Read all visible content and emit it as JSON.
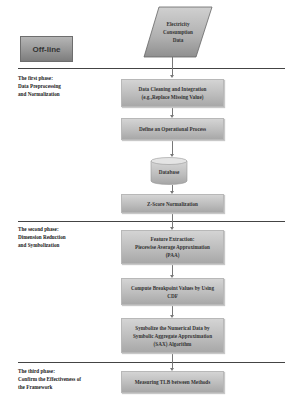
{
  "offline_label": "Off-line",
  "input": {
    "line1": "Electricity",
    "line2": "Consumption",
    "line3": "Data"
  },
  "phases": [
    {
      "line1": "The first phase:",
      "line2": "Data Preprocessing",
      "line3": "and Normalization"
    },
    {
      "line1": "The second phase:",
      "line2": "Dimension Reduction",
      "line3": "and Symbolization"
    },
    {
      "line1": "The third phase:",
      "line2": "Confirm the Effectiveness of",
      "line3": "the Framework"
    }
  ],
  "steps": {
    "cleaning": {
      "line1": "Data Cleaning and Integration",
      "line2": "(e.g.,Replace Missing Value)"
    },
    "operational": {
      "line1": "Define an Operational Process"
    },
    "database": {
      "line1": "Database"
    },
    "zscore": {
      "line1": "Z-Score Normalization"
    },
    "paa": {
      "line1": "Feature Extraction:",
      "line2": "Piecewise Average Approximation",
      "line3": "(PAA)"
    },
    "breakpoint": {
      "line1": "Compute Breakpoint Values by Using",
      "line2": "CDF"
    },
    "sax": {
      "line1": "Symbolize the Numerical Data by",
      "line2": "Symbolic Aggregate Approximation",
      "line3": "(SAX) Algorithm"
    },
    "tlb": {
      "line1": "Measuring TLB between Methods"
    }
  }
}
